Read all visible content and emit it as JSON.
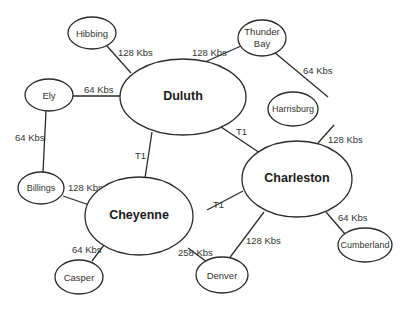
{
  "diagram": {
    "type": "network-topology",
    "nodes": [
      {
        "id": "hibbing",
        "label": "Hibbing",
        "hub": false
      },
      {
        "id": "thunder_bay",
        "label_line1": "Thunder",
        "label_line2": "Bay",
        "hub": false
      },
      {
        "id": "ely",
        "label": "Ely",
        "hub": false
      },
      {
        "id": "duluth",
        "label": "Duluth",
        "hub": true
      },
      {
        "id": "harrisburg",
        "label": "Harrisburg",
        "hub": false
      },
      {
        "id": "charleston",
        "label": "Charleston",
        "hub": true
      },
      {
        "id": "billings",
        "label": "Billings",
        "hub": false
      },
      {
        "id": "cheyenne",
        "label": "Cheyenne",
        "hub": true
      },
      {
        "id": "cumberland",
        "label": "Cumberland",
        "hub": false
      },
      {
        "id": "casper",
        "label": "Casper",
        "hub": false
      },
      {
        "id": "denver",
        "label": "Denver",
        "hub": false
      }
    ],
    "links": [
      {
        "from": "hibbing",
        "to": "duluth",
        "label": "128 Kbs"
      },
      {
        "from": "duluth",
        "to": "thunder_bay",
        "label": "128 Kbs"
      },
      {
        "from": "thunder_bay",
        "to": "harrisburg",
        "label": "64 Kbs"
      },
      {
        "from": "ely",
        "to": "duluth",
        "label": "64 Kbs"
      },
      {
        "from": "ely",
        "to": "billings",
        "label": "64 Kbs"
      },
      {
        "from": "duluth",
        "to": "charleston",
        "label": "T1"
      },
      {
        "from": "duluth",
        "to": "cheyenne",
        "label": "T1"
      },
      {
        "from": "harrisburg",
        "to": "charleston",
        "label": "128 Kbs"
      },
      {
        "from": "billings",
        "to": "cheyenne",
        "label": "128 Kbs"
      },
      {
        "from": "cheyenne",
        "to": "charleston",
        "label": "T1"
      },
      {
        "from": "charleston",
        "to": "cumberland",
        "label": "64 Kbs"
      },
      {
        "from": "cheyenne",
        "to": "casper",
        "label": "64 Kbs"
      },
      {
        "from": "cheyenne",
        "to": "denver",
        "label": "258 Kbs"
      },
      {
        "from": "charleston",
        "to": "denver",
        "label": "128 Kbs"
      }
    ]
  }
}
